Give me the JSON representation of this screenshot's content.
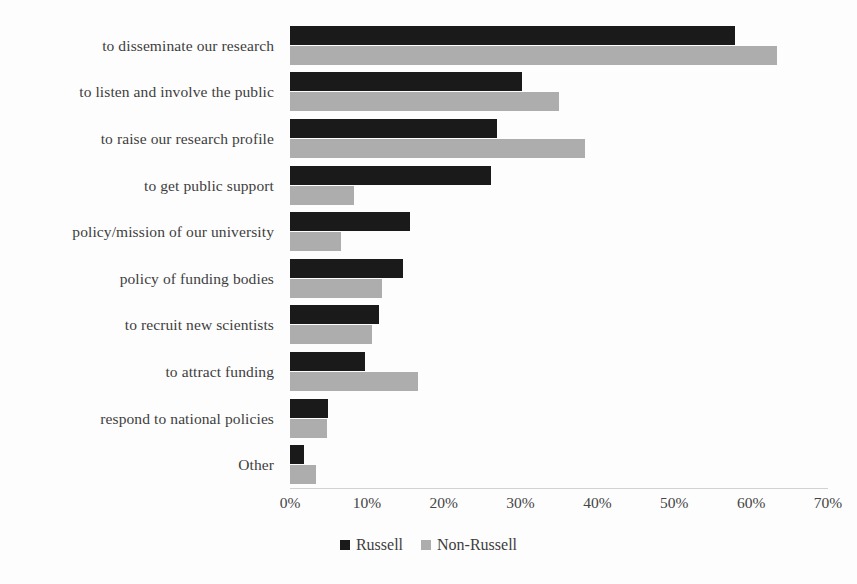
{
  "chart_data": {
    "type": "bar",
    "orientation": "horizontal",
    "title": "",
    "xlabel": "",
    "ylabel": "",
    "xlim": [
      0,
      70
    ],
    "xticks": [
      0,
      10,
      20,
      30,
      40,
      50,
      60,
      70
    ],
    "xtick_labels": [
      "0%",
      "10%",
      "20%",
      "30%",
      "40%",
      "50%",
      "60%",
      "70%"
    ],
    "grid": false,
    "legend_position": "bottom-center",
    "categories": [
      "to disseminate our research",
      "to listen and involve the public",
      "to raise our research profile",
      "to get public support",
      "policy/mission of our university",
      "policy of funding bodies",
      "to recruit new scientists",
      "to attract funding",
      "respond to national policies",
      "Other"
    ],
    "series": [
      {
        "name": "Russell",
        "color": "#1a1a1a",
        "values": [
          57.9,
          30.2,
          26.9,
          26.2,
          15.6,
          14.7,
          11.6,
          9.8,
          4.9,
          1.8
        ]
      },
      {
        "name": "Non-Russell",
        "color": "#adadad",
        "values": [
          63.3,
          35.0,
          38.4,
          8.3,
          6.6,
          12.0,
          10.7,
          16.7,
          4.8,
          3.4
        ]
      }
    ]
  }
}
